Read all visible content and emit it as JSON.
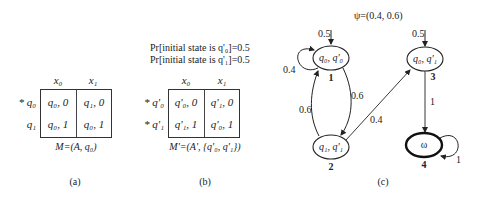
{
  "panel_a": {
    "columns": [
      "x0",
      "x1"
    ],
    "column_display": [
      "x₀",
      "x₁"
    ],
    "rows": [
      {
        "label": "* q₀",
        "cells": [
          "q₀, 0",
          "q₁, 0"
        ]
      },
      {
        "label": "q₁",
        "cells": [
          "q₀, 1",
          "q₀, 1"
        ]
      }
    ],
    "formula": "M=(A, q₀)",
    "caption": "(a)"
  },
  "panel_b": {
    "prob_lines": [
      "Pr[initial state is q'₀]=0.5",
      "Pr[initial state is q'₁]=0.5"
    ],
    "column_display": [
      "x₀",
      "x₁"
    ],
    "rows": [
      {
        "label": "* q'₀",
        "cells": [
          "q'₀, 0",
          "q'₁, 0"
        ]
      },
      {
        "label": "* q'₁",
        "cells": [
          "q'₁, 1",
          "q'₀, 1"
        ]
      }
    ],
    "formula": "M'=(A', {q'₀, q'₁})",
    "caption": "(b)"
  },
  "panel_c": {
    "psi": "ψ=(0.4, 0.6)",
    "caption": "(c)",
    "nodes": [
      {
        "id": "1",
        "label": "q₀, q'₀",
        "number": "1"
      },
      {
        "id": "2",
        "label": "q₁, q'₁",
        "number": "2"
      },
      {
        "id": "3",
        "label": "q₀, q'₁",
        "number": "3"
      },
      {
        "id": "4",
        "label": "ω",
        "number": "4",
        "accepting": true
      }
    ],
    "edges": [
      {
        "from": "start",
        "to": "1",
        "label": "0.5"
      },
      {
        "from": "start",
        "to": "3",
        "label": "0.5"
      },
      {
        "from": "1",
        "to": "1",
        "label": "0.4"
      },
      {
        "from": "1",
        "to": "2",
        "label": "0.6"
      },
      {
        "from": "2",
        "to": "1",
        "label": "0.6"
      },
      {
        "from": "2",
        "to": "3",
        "label": "0.4"
      },
      {
        "from": "3",
        "to": "4",
        "label": "1"
      },
      {
        "from": "4",
        "to": "4",
        "label": "1"
      }
    ]
  }
}
